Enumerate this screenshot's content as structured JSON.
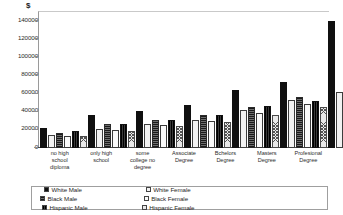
{
  "chart_data": {
    "type": "bar",
    "title": "",
    "subtitle": "",
    "xlabel": "",
    "ylabel": "$",
    "ylim": [
      0,
      150000
    ],
    "ytick_values": [
      140000,
      120000,
      100000,
      80000,
      60000,
      40000,
      20000,
      0
    ],
    "ytick_labels": [
      "140000",
      "120000",
      "100000",
      "80000",
      "60000",
      "40000",
      "20000",
      "0"
    ],
    "grid": false,
    "legend_position": "bottom",
    "categories": [
      "no high school diploma",
      "only high school",
      "some college no degree",
      "Associate Degree",
      "Bchelors Degree",
      "Masters Degree",
      "Profesional Degree"
    ],
    "category_lines": [
      [
        "no high",
        "school",
        "diploma"
      ],
      [
        "only high",
        "school"
      ],
      [
        "some",
        "college no",
        "degree"
      ],
      [
        "Associate",
        "Degree"
      ],
      [
        "Bchelors",
        "Degree"
      ],
      [
        "Masters",
        "Degree"
      ],
      [
        "Profesional",
        "Degree"
      ]
    ],
    "series": [
      {
        "name": "White Male",
        "swatch": "solid-black",
        "values": [
          22000,
          36000,
          41000,
          47000,
          64000,
          73000,
          140000
        ]
      },
      {
        "name": "White Female",
        "swatch": "horiz-lines",
        "values": [
          14000,
          21000,
          26000,
          31000,
          42000,
          53000,
          62000
        ]
      },
      {
        "name": "Black Male",
        "swatch": "dark-grey",
        "values": [
          17000,
          27000,
          31000,
          36000,
          45000,
          56000,
          null
        ]
      },
      {
        "name": "Black Female",
        "swatch": "grid-hatch",
        "values": [
          13000,
          20000,
          25000,
          30000,
          39000,
          48000,
          null
        ]
      },
      {
        "name": "Hispanic Male",
        "swatch": "near-black",
        "values": [
          19000,
          26000,
          31000,
          36000,
          46000,
          52000,
          null
        ]
      },
      {
        "name": "Hispanic Female",
        "swatch": "cross-hatch",
        "values": [
          13000,
          19000,
          24000,
          29000,
          36000,
          45000,
          null
        ]
      }
    ]
  },
  "legend": {
    "items": [
      {
        "label": "White Male"
      },
      {
        "label": "White Female"
      },
      {
        "label": "Black Male"
      },
      {
        "label": "Black Female"
      },
      {
        "label": "Hispanic Male"
      },
      {
        "label": "Hispanic Female"
      }
    ]
  }
}
